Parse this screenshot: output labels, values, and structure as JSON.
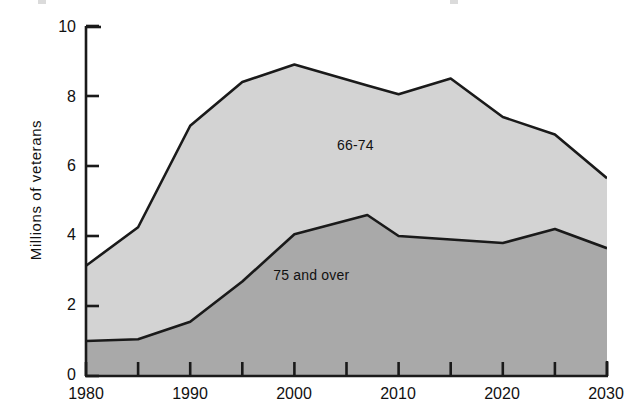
{
  "chart_data": {
    "type": "area",
    "stacked": true,
    "title": "",
    "xlabel": "",
    "ylabel": "Millions of veterans",
    "xlim": [
      1980,
      2030
    ],
    "ylim": [
      0,
      10
    ],
    "grid": false,
    "legend_position": "inline-annotation",
    "y_ticks": [
      0,
      2,
      4,
      6,
      8,
      10
    ],
    "y_tick_labels": [
      "0",
      "2",
      "4",
      "6",
      "8",
      "10"
    ],
    "x_ticks": [
      1980,
      1985,
      1990,
      1995,
      2000,
      2005,
      2010,
      2015,
      2020,
      2025,
      2030
    ],
    "x_tick_labels": [
      "1980",
      "",
      "1990",
      "",
      "2000",
      "",
      "2010",
      "",
      "2020",
      "",
      "2030"
    ],
    "x_labeled_ticks": [
      1980,
      1990,
      2000,
      2010,
      2020,
      2030
    ],
    "x": [
      1980,
      1985,
      1990,
      1995,
      2000,
      2007,
      2010,
      2015,
      2020,
      2025,
      2030
    ],
    "series": [
      {
        "name": "75 and over",
        "label": "75 and over",
        "color": "#a9a9a9",
        "values": [
          1.0,
          1.05,
          1.55,
          2.7,
          4.05,
          4.6,
          4.0,
          3.9,
          3.8,
          4.2,
          3.65
        ]
      },
      {
        "name": "66-74",
        "label": "66-74",
        "color": "#d3d3d3",
        "values": [
          2.15,
          3.2,
          5.6,
          5.7,
          4.85,
          3.7,
          4.05,
          4.6,
          3.6,
          2.7,
          2.0
        ]
      }
    ],
    "totals": [
      3.15,
      4.25,
      7.15,
      8.4,
      8.9,
      8.3,
      8.05,
      8.5,
      7.4,
      6.9,
      5.65
    ],
    "annotations": [
      {
        "text": "66-74",
        "x_value": 2006,
        "y_value": 6.6
      },
      {
        "text": "75 and over",
        "x_value": 2002,
        "y_value": 2.9
      }
    ]
  },
  "axis": {
    "y_title": "Millions of veterans",
    "y_labels": [
      "10",
      "8",
      "6",
      "4",
      "2",
      "0"
    ],
    "x_labels": [
      "1980",
      "1990",
      "2000",
      "2010",
      "2020",
      "2030"
    ]
  },
  "annotations": {
    "upper_band": "66-74",
    "lower_band": "75 and over"
  },
  "colors": {
    "upper_band_fill": "#d3d3d3",
    "lower_band_fill": "#a9a9a9",
    "line": "#1a1a1a",
    "axis": "#1a1a1a",
    "background": "#ffffff"
  }
}
